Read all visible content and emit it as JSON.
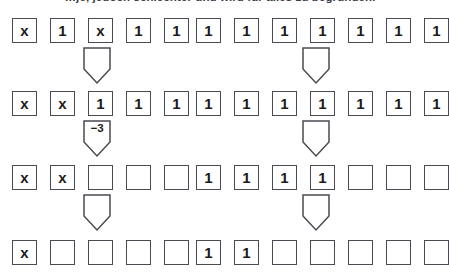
{
  "caption": "…je, jedoch schlechter und wird für alles zu begründen.",
  "geometry": {
    "cell_size": 25,
    "cell_pitch": 38,
    "group_left_x": 12,
    "group_right_x": 196,
    "row_tops": [
      18,
      91,
      165,
      240
    ],
    "arrow_tops": [
      47,
      120,
      194
    ],
    "arrow_left_x": 82,
    "arrow_right_x": 301
  },
  "colors": {
    "box_border": "#4a4a52",
    "text": "#1b1b1b",
    "caption": "#3a3a44",
    "background": "#ffffff"
  },
  "rows": [
    {
      "name": "row-1",
      "left": [
        "x",
        "1",
        "x",
        "1",
        "1"
      ],
      "right": [
        "1",
        "1",
        "1",
        "1",
        "1",
        "1",
        "1"
      ]
    },
    {
      "name": "row-2",
      "left": [
        "x",
        "x",
        "1",
        "1",
        "1"
      ],
      "right": [
        "1",
        "1",
        "1",
        "1",
        "1",
        "1",
        "1"
      ]
    },
    {
      "name": "row-3",
      "left": [
        "x",
        "x",
        "",
        "",
        ""
      ],
      "right": [
        "1",
        "1",
        "1",
        "1",
        "",
        "",
        ""
      ]
    },
    {
      "name": "row-4",
      "left": [
        "x",
        "",
        "",
        "",
        ""
      ],
      "right": [
        "1",
        "1",
        "",
        "",
        "",
        "",
        ""
      ]
    }
  ],
  "arrows": [
    {
      "name": "arrow-left-1",
      "label": ""
    },
    {
      "name": "arrow-right-1",
      "label": ""
    },
    {
      "name": "arrow-left-2",
      "label": "−3"
    },
    {
      "name": "arrow-right-2",
      "label": ""
    },
    {
      "name": "arrow-left-3",
      "label": ""
    },
    {
      "name": "arrow-right-3",
      "label": ""
    }
  ]
}
